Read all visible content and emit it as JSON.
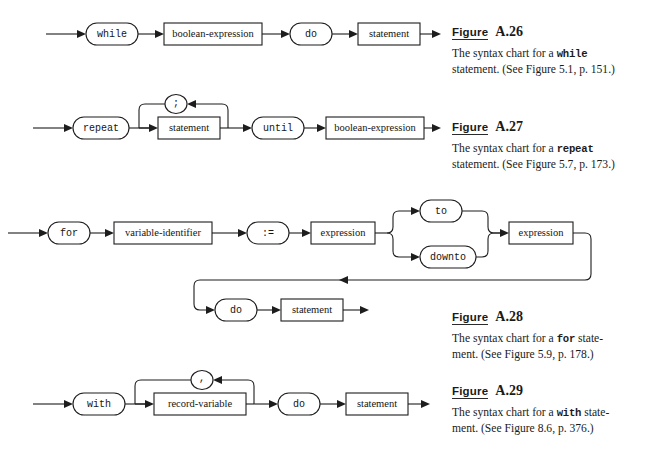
{
  "page": {
    "width": 654,
    "height": 449,
    "background": "#ffffff",
    "ink": "#1d1d1d",
    "kind": "Pascal syntax (railroad) charts page from an appendix"
  },
  "figures": [
    {
      "id": "A.26",
      "figure_word": "Figure",
      "number": "A.26",
      "caption_pre": "The syntax chart for a ",
      "caption_mono": "while",
      "caption_post": "",
      "caption_line2": "statement. (See Figure 5.1, p. 151.)",
      "chart": {
        "name": "while-statement-syntax-chart",
        "nodes": [
          {
            "kind": "terminal",
            "label": "while"
          },
          {
            "kind": "nonterminal",
            "label": "boolean-expression"
          },
          {
            "kind": "terminal",
            "label": "do"
          },
          {
            "kind": "nonterminal",
            "label": "statement"
          }
        ]
      }
    },
    {
      "id": "A.27",
      "figure_word": "Figure",
      "number": "A.27",
      "caption_pre": "The syntax chart for a ",
      "caption_mono": "repeat",
      "caption_post": "",
      "caption_line2": "statement. (See Figure 5.7, p. 173.)",
      "chart": {
        "name": "repeat-statement-syntax-chart",
        "nodes": [
          {
            "kind": "terminal",
            "label": "repeat"
          },
          {
            "kind": "nonterminal",
            "label": "statement"
          },
          {
            "kind": "terminal",
            "label": "until"
          },
          {
            "kind": "nonterminal",
            "label": "boolean-expression"
          }
        ],
        "loop": {
          "kind": "terminal",
          "label": ";"
        }
      }
    },
    {
      "id": "A.28",
      "figure_word": "Figure",
      "number": "A.28",
      "caption_pre": "The syntax chart for a ",
      "caption_mono": "for",
      "caption_post": " state-",
      "caption_line2": "ment. (See Figure 5.9, p. 178.)",
      "chart": {
        "name": "for-statement-syntax-chart",
        "nodes": [
          {
            "kind": "terminal",
            "label": "for"
          },
          {
            "kind": "nonterminal",
            "label": "variable-identifier"
          },
          {
            "kind": "terminal",
            "label": ":="
          },
          {
            "kind": "nonterminal",
            "label": "expression"
          },
          {
            "kind": "terminal",
            "label": "to"
          },
          {
            "kind": "terminal",
            "label": "downto"
          },
          {
            "kind": "nonterminal",
            "label": "expression"
          },
          {
            "kind": "terminal",
            "label": "do"
          },
          {
            "kind": "nonterminal",
            "label": "statement"
          }
        ]
      }
    },
    {
      "id": "A.29",
      "figure_word": "Figure",
      "number": "A.29",
      "caption_pre": "The syntax chart for a ",
      "caption_mono": "with",
      "caption_post": " state-",
      "caption_line2": "ment. (See Figure 8.6, p. 376.)",
      "chart": {
        "name": "with-statement-syntax-chart",
        "nodes": [
          {
            "kind": "terminal",
            "label": "with"
          },
          {
            "kind": "nonterminal",
            "label": "record-variable"
          },
          {
            "kind": "terminal",
            "label": "do"
          },
          {
            "kind": "nonterminal",
            "label": "statement"
          }
        ],
        "loop": {
          "kind": "terminal",
          "label": ","
        }
      }
    }
  ],
  "labels": {
    "while": "while",
    "boolean_expression": "boolean-expression",
    "do": "do",
    "statement": "statement",
    "repeat": "repeat",
    "until": "until",
    "semicolon": ";",
    "comma": ",",
    "for": "for",
    "variable_identifier": "variable-identifier",
    "assign": ":=",
    "expression": "expression",
    "to": "to",
    "downto": "downto",
    "with": "with",
    "record_variable": "record-variable"
  }
}
